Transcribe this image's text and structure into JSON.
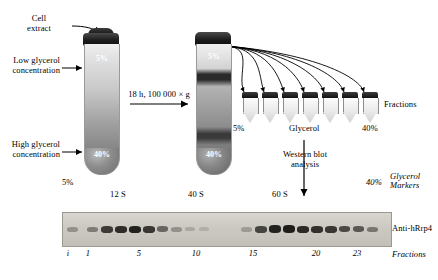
{
  "labels": {
    "cell_extract": "Cell\nextract",
    "low_glycerol": "Low glycerol\nconcentration",
    "high_glycerol": "High glycerol\nconcentration",
    "spin": "18 h, 100 000 × g",
    "western": "Western blot\nanalysis",
    "fractions_right": "Fractions",
    "fractions_bottom": "Fractions",
    "glycerol_center": "Glycerol",
    "glycerol_markers": "Glycerol\nMarkers",
    "antibody": "Anti-hRrp4"
  },
  "percents": {
    "tube1_top": "5%",
    "tube1_bottom": "40%",
    "tube2_top": "5%",
    "tube2_bottom": "40%",
    "fraction_start": "5%",
    "fraction_end": "40%",
    "gradient_left": "5%",
    "gradient_right": "40%"
  },
  "svedberg": [
    {
      "value": "12 S",
      "x": 118
    },
    {
      "value": "40 S",
      "x": 196
    },
    {
      "value": "60 S",
      "x": 280
    }
  ],
  "lane_numbers": [
    {
      "label": "i",
      "x": 68,
      "italic": true
    },
    {
      "label": "1",
      "x": 88,
      "italic": true
    },
    {
      "label": "5",
      "x": 139,
      "italic": true
    },
    {
      "label": "10",
      "x": 196,
      "italic": true
    },
    {
      "label": "15",
      "x": 253,
      "italic": true
    },
    {
      "label": "20",
      "x": 316,
      "italic": true
    },
    {
      "label": "23",
      "x": 357,
      "italic": true
    }
  ],
  "fraction_tubes": [
    {
      "x": 242
    },
    {
      "x": 262
    },
    {
      "x": 282
    },
    {
      "x": 302
    },
    {
      "x": 322
    },
    {
      "x": 342
    },
    {
      "x": 362
    }
  ],
  "gel_bands": [
    {
      "x": 66,
      "w": 11,
      "h": 5,
      "opacity": 0.3
    },
    {
      "x": 86,
      "w": 11,
      "h": 5,
      "opacity": 0.42
    },
    {
      "x": 100,
      "w": 12,
      "h": 7,
      "opacity": 0.78
    },
    {
      "x": 114,
      "w": 12,
      "h": 7,
      "opacity": 0.86
    },
    {
      "x": 128,
      "w": 12,
      "h": 7,
      "opacity": 0.92
    },
    {
      "x": 142,
      "w": 12,
      "h": 7,
      "opacity": 0.8
    },
    {
      "x": 156,
      "w": 11,
      "h": 6,
      "opacity": 0.55
    },
    {
      "x": 170,
      "w": 11,
      "h": 5,
      "opacity": 0.3
    },
    {
      "x": 184,
      "w": 10,
      "h": 4,
      "opacity": 0.18
    },
    {
      "x": 198,
      "w": 10,
      "h": 4,
      "opacity": 0.14
    },
    {
      "x": 240,
      "w": 11,
      "h": 5,
      "opacity": 0.25
    },
    {
      "x": 254,
      "w": 12,
      "h": 7,
      "opacity": 0.72
    },
    {
      "x": 268,
      "w": 12,
      "h": 8,
      "opacity": 0.92
    },
    {
      "x": 282,
      "w": 12,
      "h": 8,
      "opacity": 0.95
    },
    {
      "x": 296,
      "w": 12,
      "h": 7,
      "opacity": 0.88
    },
    {
      "x": 310,
      "w": 12,
      "h": 7,
      "opacity": 0.84
    },
    {
      "x": 324,
      "w": 12,
      "h": 7,
      "opacity": 0.8
    },
    {
      "x": 338,
      "w": 11,
      "h": 6,
      "opacity": 0.7
    },
    {
      "x": 352,
      "w": 11,
      "h": 6,
      "opacity": 0.62
    },
    {
      "x": 366,
      "w": 11,
      "h": 5,
      "opacity": 0.45
    }
  ],
  "colors": {
    "ink": "#000000",
    "gel_bg": "#cdcac4",
    "tube_cap": "#1d1d1d"
  }
}
